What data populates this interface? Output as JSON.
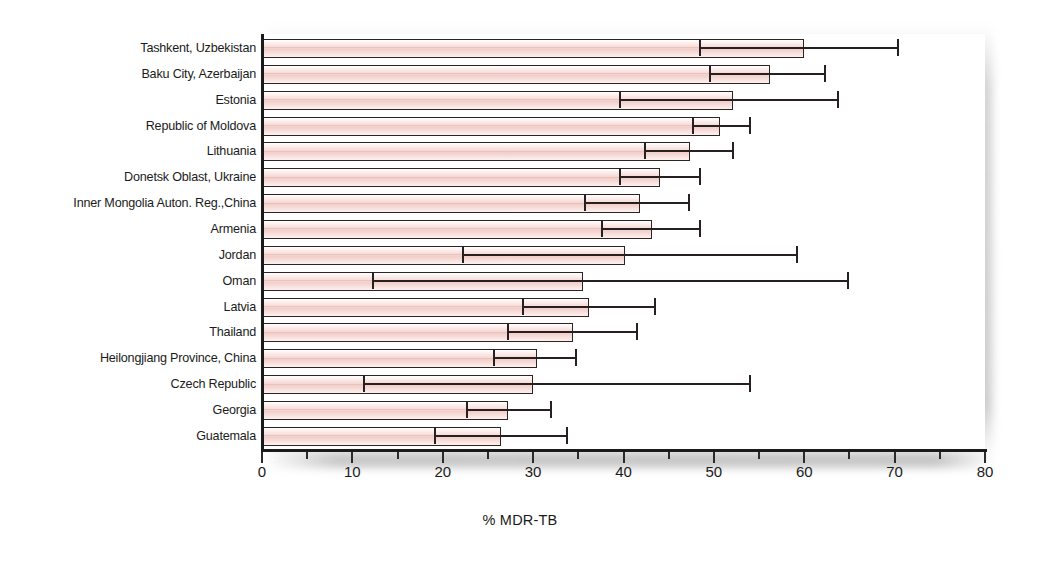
{
  "chart_data": {
    "type": "bar",
    "orientation": "horizontal",
    "title": "",
    "subtitle": "",
    "xlabel": "% MDR-TB",
    "ylabel": "",
    "xlim": [
      0,
      80
    ],
    "xticks": [
      0,
      10,
      20,
      30,
      40,
      50,
      60,
      70,
      80
    ],
    "xtick_labels": [
      "0",
      "10",
      "20",
      "30",
      "40",
      "50",
      "60",
      "70",
      "80"
    ],
    "minor_xticks": [
      5,
      15,
      25,
      35,
      45,
      55,
      65,
      75
    ],
    "grid": false,
    "legend": null,
    "error_bars": "95% confidence interval",
    "categories": [
      "Tashkent, Uzbekistan",
      "Baku City, Azerbaijan",
      "Estonia",
      "Republic of Moldova",
      "Lithuania",
      "Donetsk Oblast, Ukraine",
      "Inner Mongolia Auton. Reg.,China",
      "Armenia",
      "Jordan",
      "Oman",
      "Latvia",
      "Thailand",
      "Heilongjiang Province, China",
      "Czech Republic",
      "Georgia",
      "Guatemala"
    ],
    "values": [
      60.0,
      56.2,
      52.1,
      50.7,
      47.4,
      44.0,
      41.8,
      43.1,
      40.2,
      35.5,
      36.2,
      34.4,
      30.4,
      30.0,
      27.2,
      26.4
    ],
    "ci_low": [
      48.5,
      49.6,
      39.6,
      47.7,
      42.4,
      39.6,
      35.7,
      37.6,
      22.2,
      12.3,
      28.9,
      27.2,
      25.7,
      11.3,
      22.7,
      19.1
    ],
    "ci_high": [
      70.4,
      62.3,
      63.7,
      54.0,
      52.1,
      48.5,
      47.3,
      48.5,
      59.2,
      64.8,
      43.5,
      41.5,
      34.7,
      54.0,
      32.0,
      33.7
    ]
  },
  "style": {
    "bar_fill": "#f4d5d0",
    "bar_edge": "#2a2424",
    "error_color": "#272020",
    "axis_color": "#1a1a1a",
    "text_color": "#1b1b1b",
    "background": "#ffffff"
  }
}
